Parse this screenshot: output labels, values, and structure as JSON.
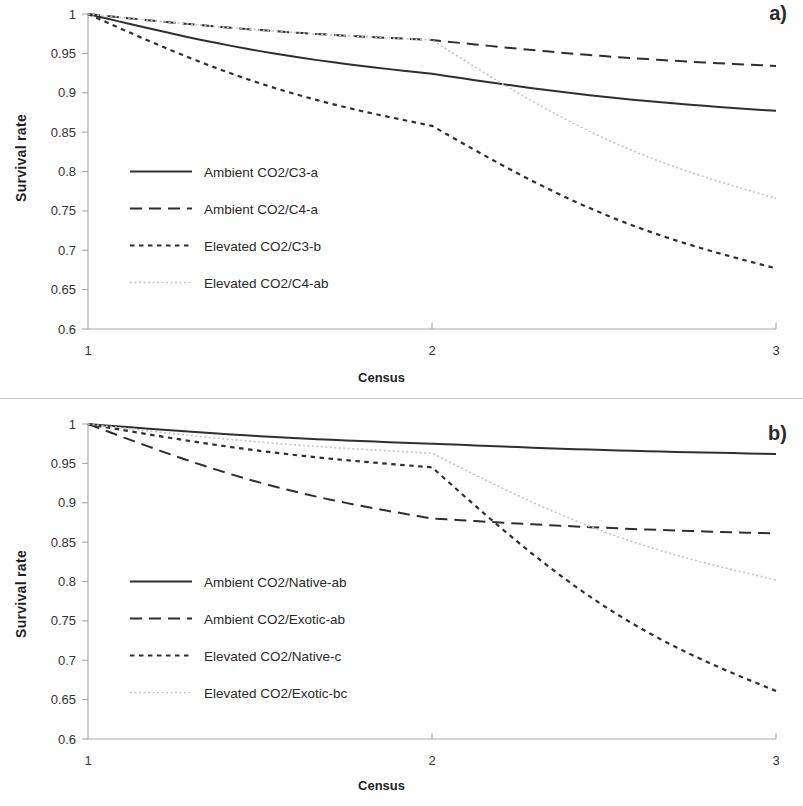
{
  "figure": {
    "axis_label_y": "Survival rate",
    "axis_label_x": "Census",
    "panel_a_letter": "a)",
    "panel_b_letter": "b)",
    "y_ticks": [
      "1",
      "0.95",
      "0.9",
      "0.85",
      "0.8",
      "0.75",
      "0.7",
      "0.65",
      "0.6"
    ],
    "x_ticks": [
      "1",
      "2",
      "3"
    ],
    "colors": {
      "line_dark": "#2f2f2f",
      "line_light": "#c5c5c5",
      "axis": "#a6a6a6",
      "text": "#2a2a2a"
    }
  },
  "chart_data": [
    {
      "type": "line",
      "panel": "a",
      "title": "a)",
      "xlabel": "Census",
      "ylabel": "Survival rate",
      "x": [
        1,
        2,
        3
      ],
      "categories": [
        "1",
        "2",
        "3"
      ],
      "xlim": [
        1,
        3
      ],
      "ylim": [
        0.6,
        1
      ],
      "grid": false,
      "legend_position": "inside-left",
      "series": [
        {
          "name": "Ambient CO2/C3-a",
          "style": "solid",
          "color": "#2f2f2f",
          "values": [
            1.0,
            0.924,
            0.877
          ]
        },
        {
          "name": "Ambient CO2/C4-a",
          "style": "dashed",
          "color": "#2f2f2f",
          "values": [
            1.0,
            0.967,
            0.934
          ]
        },
        {
          "name": "Elevated CO2/C3-b",
          "style": "dotted",
          "color": "#2f2f2f",
          "values": [
            1.0,
            0.858,
            0.677
          ]
        },
        {
          "name": "Elevated CO2/C4-ab",
          "style": "fine-dotted",
          "color": "#c5c5c5",
          "values": [
            1.0,
            0.967,
            0.766
          ]
        }
      ]
    },
    {
      "type": "line",
      "panel": "b",
      "title": "b)",
      "xlabel": "Census",
      "ylabel": "Survival rate",
      "x": [
        1,
        2,
        3
      ],
      "categories": [
        "1",
        "2",
        "3"
      ],
      "xlim": [
        1,
        3
      ],
      "ylim": [
        0.6,
        1
      ],
      "grid": false,
      "legend_position": "inside-left",
      "series": [
        {
          "name": "Ambient CO2/Native-ab",
          "style": "solid",
          "color": "#2f2f2f",
          "values": [
            1.0,
            0.975,
            0.962
          ]
        },
        {
          "name": "Ambient CO2/Exotic-ab",
          "style": "dashed",
          "color": "#2f2f2f",
          "values": [
            1.0,
            0.88,
            0.861
          ]
        },
        {
          "name": "Elevated CO2/Native-c",
          "style": "dotted",
          "color": "#2f2f2f",
          "values": [
            1.0,
            0.945,
            0.661
          ]
        },
        {
          "name": "Elevated CO2/Exotic-bc",
          "style": "fine-dotted",
          "color": "#c5c5c5",
          "values": [
            1.0,
            0.963,
            0.802
          ]
        }
      ]
    }
  ]
}
